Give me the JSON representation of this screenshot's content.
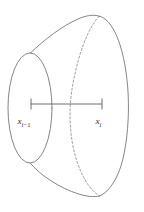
{
  "figure": {
    "kind": "solid-of-revolution-slab",
    "background_color": "#ffffff",
    "stroke_color": "#6f6f75",
    "dashed_stroke_color": "#8a8a90",
    "axis_color": "#5d5d63",
    "label_color": "#2b2b2f",
    "width": 144,
    "height": 212
  },
  "labels": {
    "left": {
      "variable": "x",
      "subscript_index": "i",
      "subscript_operator": "−",
      "subscript_offset": "1",
      "full_text": "x i−1"
    },
    "right": {
      "variable": "x",
      "subscript_index": "i",
      "full_text": "x i"
    }
  },
  "axis": {
    "x_start": 31,
    "x_end": 102,
    "y": 104,
    "tick_half_height": 5.5,
    "dashed_crossing_x": 70
  },
  "geometry": {
    "left_ellipse": {
      "center_x": 30,
      "center_y": 108,
      "radius_x": 22,
      "radius_y": 55
    },
    "right_ellipse": {
      "center_x": 100,
      "center_y": 106,
      "radius_x": 28,
      "radius_y": 90
    },
    "cusp_top": {
      "x": 30,
      "y": 53
    },
    "cusp_bottom": {
      "x": 30,
      "y": 163
    },
    "silhouette_top_peak": {
      "x": 99,
      "y": 16
    },
    "silhouette_bottom_low": {
      "x": 99,
      "y": 196
    },
    "right_bulge_x": 128
  }
}
